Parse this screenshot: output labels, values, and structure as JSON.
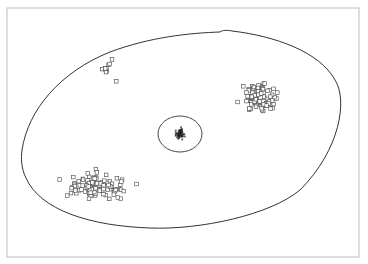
{
  "figure": {
    "colors": {
      "frame": "#c8c8c8",
      "outline": "#333333",
      "marker": "#444444",
      "core": "#222222"
    },
    "clusters": [
      {
        "name": "upper-left-sparse",
        "count": 10
      },
      {
        "name": "upper-right-dense",
        "count": 90
      },
      {
        "name": "lower-left-dense",
        "count": 95
      },
      {
        "name": "central-core",
        "count": 60
      }
    ]
  }
}
